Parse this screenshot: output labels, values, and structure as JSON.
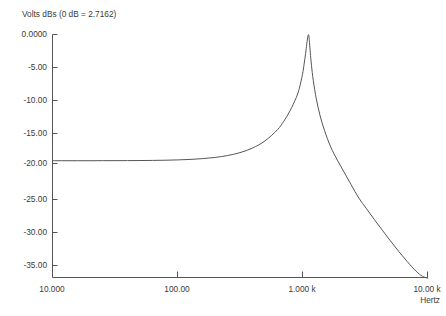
{
  "chart_data": {
    "type": "line",
    "title": "Volts dBs   (0 dB = 2.7162)",
    "title_parts": {
      "quantity": "Volts dBs",
      "reference": "(0 dB = 2.7162)"
    },
    "xlabel": "Hertz",
    "ylabel": "",
    "xscale": "log",
    "xlim": [
      10,
      10000
    ],
    "ylim": [
      -38.5,
      0
    ],
    "grid": false,
    "legend": null,
    "xticks": [
      10,
      100,
      1000,
      10000
    ],
    "xticklabels": [
      "10.000",
      "100.00",
      "1.000 k",
      "10.00 k"
    ],
    "yticks": [
      0,
      -5,
      -10,
      -15,
      -20,
      -25,
      -30,
      -35
    ],
    "yticklabels": [
      "0.0000",
      "-5.00",
      "-10.00",
      "-15.00",
      "-20.00",
      "-25.00",
      "-30.00",
      "-35.00"
    ],
    "series": [
      {
        "name": "response",
        "color": "#555555",
        "x": [
          10,
          12.6,
          15.8,
          20,
          25.1,
          31.6,
          39.8,
          50.1,
          63.1,
          79.4,
          100,
          126,
          158,
          200,
          251,
          316,
          398,
          501,
          631,
          708,
          794,
          891,
          944,
          1000,
          1030,
          1059,
          1080,
          1096,
          1107,
          1115,
          1122,
          1130,
          1140,
          1155,
          1180,
          1220,
          1290,
          1380,
          1500,
          1680,
          1900,
          2150,
          2450,
          2820,
          3250,
          3750,
          4350,
          5050,
          5900,
          6900,
          8100,
          9100,
          10000
        ],
        "y": [
          -20.0,
          -20.0,
          -20.0,
          -20.0,
          -19.99,
          -19.99,
          -19.98,
          -19.97,
          -19.95,
          -19.92,
          -19.87,
          -19.79,
          -19.67,
          -19.48,
          -19.18,
          -18.72,
          -17.99,
          -16.86,
          -15.08,
          -13.75,
          -12.1,
          -10.0,
          -8.5,
          -6.3,
          -4.7,
          -3.0,
          -1.6,
          -0.7,
          -0.2,
          -0.02,
          -0.1,
          -0.6,
          -1.5,
          -2.9,
          -4.9,
          -7.3,
          -10.2,
          -12.8,
          -15.2,
          -17.8,
          -19.9,
          -21.8,
          -23.8,
          -25.9,
          -27.6,
          -29.3,
          -31.0,
          -32.7,
          -34.4,
          -36.0,
          -37.5,
          -38.3,
          -38.6
        ]
      }
    ],
    "annotations": {
      "peak_db": 0.0,
      "passband_db": -20.0,
      "peak_frequency_hz": 1115
    }
  },
  "axis": {
    "x_unit_label": "Hertz"
  }
}
